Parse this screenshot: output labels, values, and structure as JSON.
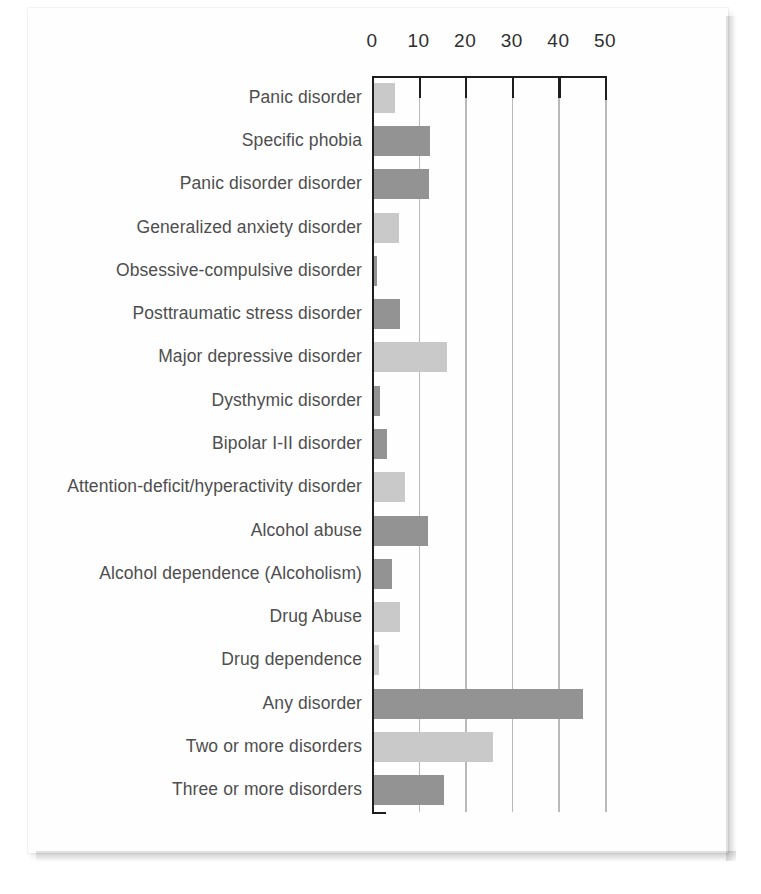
{
  "figure": {
    "title": "",
    "background_color": "#ffffff",
    "sheet_color": "#fefefe"
  },
  "colors": {
    "bar_light": "#c9c9c9",
    "bar_dark": "#939393",
    "axis": "#1d1d1d",
    "gridline": "#b9b9b9",
    "label_text": "#4e4e4e",
    "tick_text": "#2f2f2f"
  },
  "chart_data": {
    "type": "bar",
    "orientation": "horizontal",
    "title": "",
    "xlabel": "",
    "ylabel": "",
    "xlim": [
      0,
      50
    ],
    "xticks": [
      0,
      10,
      20,
      30,
      40,
      50
    ],
    "xtick_labels": [
      "0",
      "10",
      "20",
      "30",
      "40",
      "50"
    ],
    "grid": true,
    "legend": "none",
    "categories": [
      "Panic disorder",
      "Specific phobia",
      "Panic disorder disorder",
      "Generalized anxiety disorder",
      "Obsessive-compulsive disorder",
      "Posttraumatic stress disorder",
      "Major depressive disorder",
      "Dysthymic disorder",
      "Bipolar I-II disorder",
      "Attention-deficit/hyperactivity disorder",
      "Alcohol abuse",
      "Alcohol dependence (Alcoholism)",
      "Drug Abuse",
      "Drug dependence",
      "Any disorder",
      "Two or more disorders",
      "Three or more disorders"
    ],
    "values": [
      5.0,
      12.5,
      12.3,
      5.7,
      1.0,
      6.0,
      16.2,
      1.7,
      3.3,
      7.0,
      12.0,
      4.3,
      6.0,
      1.5,
      45.2,
      26.0,
      15.5
    ],
    "bar_shades": [
      "light",
      "dark",
      "dark",
      "light",
      "dark",
      "dark",
      "light",
      "dark",
      "dark",
      "light",
      "dark",
      "dark",
      "light",
      "light",
      "dark",
      "light",
      "dark"
    ]
  }
}
